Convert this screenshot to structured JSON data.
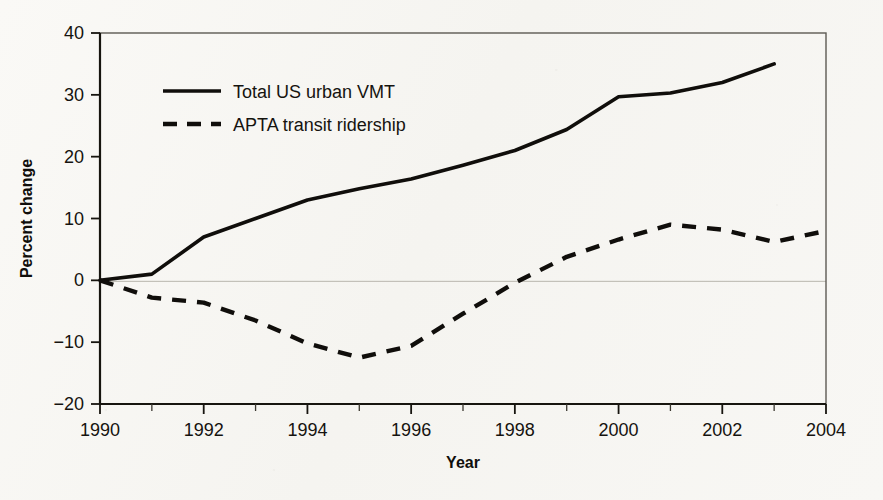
{
  "chart_data": {
    "type": "line",
    "title": "",
    "xlabel": "Year",
    "ylabel": "Percent change",
    "xlim": [
      1990,
      2004
    ],
    "ylim": [
      -20,
      40
    ],
    "xticks": [
      1990,
      1992,
      1994,
      1996,
      1998,
      2000,
      2002,
      2004
    ],
    "xtick_labels": [
      "1990",
      "1992",
      "1994",
      "1996",
      "1998",
      "2000",
      "2002",
      "2004"
    ],
    "yticks": [
      -20,
      -10,
      0,
      10,
      20,
      30,
      40
    ],
    "ytick_labels": [
      "−20",
      "−10",
      "0",
      "10",
      "20",
      "30",
      "40"
    ],
    "x_minor_ticks": [
      1991,
      1993,
      1995,
      1997,
      1999,
      2001,
      2003
    ],
    "grid": "zero-line-only",
    "legend_position": "upper-left-inside",
    "series": [
      {
        "name": "Total US urban VMT",
        "style": "solid",
        "color": "#100e0b",
        "x": [
          1990,
          1991,
          1992,
          1993,
          1994,
          1995,
          1996,
          1997,
          1998,
          1999,
          2000,
          2001,
          2002,
          2003
        ],
        "values": [
          0,
          1,
          7,
          10,
          13,
          14.8,
          16.4,
          18.6,
          21,
          24.4,
          29.7,
          30.3,
          32,
          35
        ]
      },
      {
        "name": "APTA transit ridership",
        "style": "dashed",
        "color": "#100e0b",
        "x": [
          1990,
          1991,
          1992,
          1993,
          1994,
          1995,
          1996,
          1997,
          1998,
          1999,
          2000,
          2001,
          2002,
          2003,
          2004
        ],
        "values": [
          0,
          -2.8,
          -3.6,
          -6.5,
          -10.2,
          -12.5,
          -10.6,
          -5.4,
          -0.4,
          3.8,
          6.6,
          9.0,
          8.2,
          6.2,
          8.0
        ]
      }
    ]
  },
  "legend": {
    "items": [
      {
        "label": "Total US urban VMT",
        "style": "solid"
      },
      {
        "label": "APTA transit ridership",
        "style": "dashed"
      }
    ]
  },
  "axes": {
    "x_title": "Year",
    "y_title": "Percent change"
  }
}
